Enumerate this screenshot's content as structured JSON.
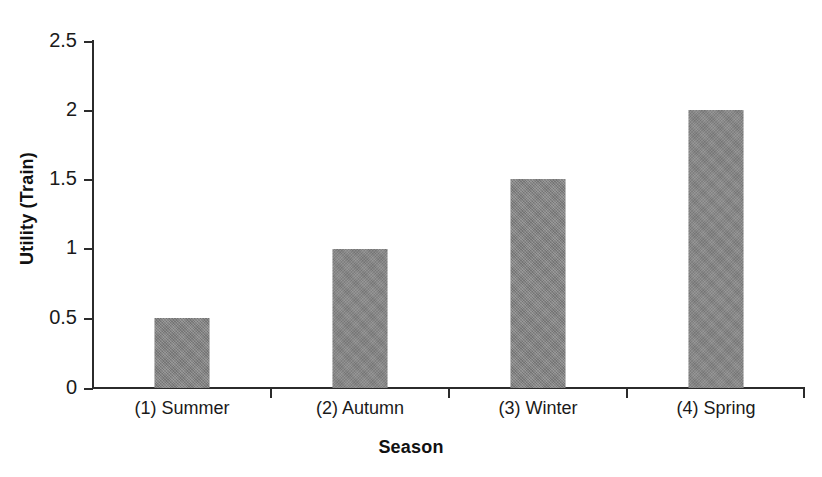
{
  "chart_data": {
    "type": "bar",
    "title": "",
    "categories": [
      "(1) Summer",
      "(2) Autumn",
      "(3) Winter",
      "(4) Spring"
    ],
    "values": [
      0.5,
      1,
      1.5,
      2
    ],
    "xlabel": "Season",
    "ylabel": "Utility (Train)",
    "ylim": [
      0,
      2.5
    ],
    "ytick_labels": [
      "2.5",
      "2",
      "1.5",
      "1",
      "0.5",
      "0"
    ],
    "ytick_values": [
      2.5,
      2,
      1.5,
      1,
      0.5,
      0
    ],
    "grid": false,
    "legend": null,
    "bar_color": "#848484",
    "axis_color": "#2b2b2b",
    "background": "#ffffff"
  }
}
